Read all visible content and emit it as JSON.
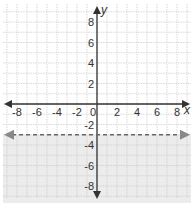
{
  "chart_data": {
    "type": "line",
    "title": "",
    "xlabel": "x",
    "ylabel": "y",
    "xlim": [
      -9,
      9
    ],
    "ylim": [
      -9,
      9
    ],
    "grid": true,
    "x_ticks": [
      -8,
      -6,
      -4,
      -2,
      0,
      2,
      4,
      6,
      8
    ],
    "y_ticks": [
      8,
      6,
      4,
      2,
      -2,
      -4,
      -6,
      -8
    ],
    "x_tick_labels": [
      "-8",
      "-6",
      "-4",
      "-2",
      "0",
      "2",
      "4",
      "6",
      "8"
    ],
    "y_tick_labels": [
      "8",
      "6",
      "4",
      "2",
      "-2",
      "-4",
      "-6",
      "-8"
    ],
    "series": [
      {
        "name": "boundary",
        "equation": "y = -3",
        "style": "dashed",
        "x": [
          -9,
          9
        ],
        "y": [
          -3,
          -3
        ]
      }
    ],
    "shaded_region": "below y = -3",
    "inequality": "y < -3"
  },
  "labels": {
    "x_axis": "x",
    "y_axis": "y",
    "origin": "0"
  },
  "colors": {
    "grid": "#c8c8c8",
    "axis": "#333333",
    "boundary": "#666666",
    "shade": "#ececec"
  }
}
